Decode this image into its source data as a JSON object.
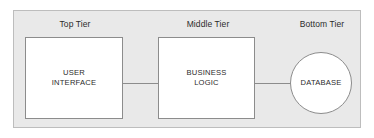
{
  "diagram": {
    "background_color": "#e9e9e9",
    "node_fill_color": "#ffffff",
    "border_color": "#8c8c8c",
    "text_color": "#2b2b2b",
    "tiers": [
      {
        "id": "top",
        "label": "Top Tier"
      },
      {
        "id": "middle",
        "label": "Middle Tier"
      },
      {
        "id": "bottom",
        "label": "Bottom Tier"
      }
    ],
    "nodes": [
      {
        "id": "user-interface",
        "label": "USER\nINTERFACE",
        "shape": "rectangle",
        "tier": "top"
      },
      {
        "id": "business-logic",
        "label": "BUSINESS\nLOGIC",
        "shape": "rectangle",
        "tier": "middle"
      },
      {
        "id": "database",
        "label": "DATABASE",
        "shape": "circle",
        "tier": "bottom"
      }
    ],
    "connectors": [
      {
        "id": "ui-to-logic",
        "from": "user-interface",
        "to": "business-logic",
        "style": "line"
      },
      {
        "id": "logic-to-db",
        "from": "business-logic",
        "to": "database",
        "style": "line"
      }
    ]
  }
}
